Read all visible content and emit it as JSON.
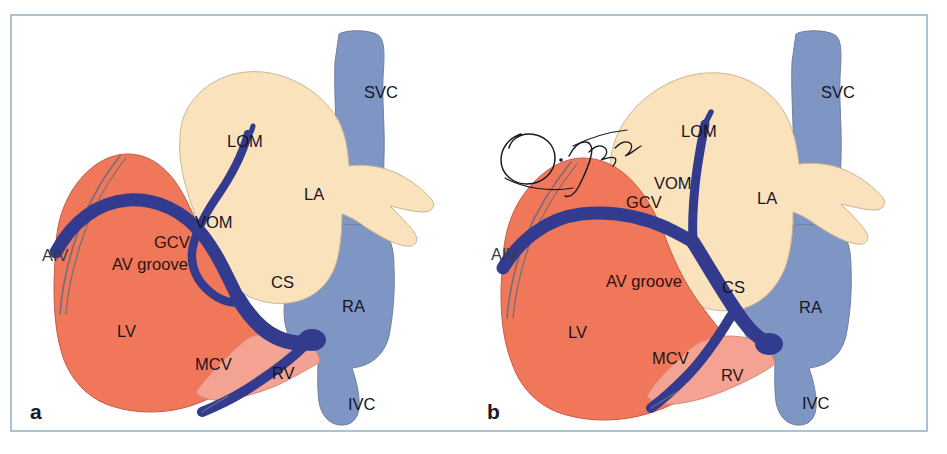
{
  "figure": {
    "kind": "anatomical-illustration",
    "panel_count": 2,
    "frame_color": "#a9c3d4",
    "background": "#ffffff"
  },
  "colors": {
    "left_ventricle_red": "#f0775a",
    "right_ventricle_pink": "#f4a393",
    "atrium_cream": "#fae2bc",
    "venous_blue": "#7f96c4",
    "vein_navy": "#323b8d",
    "outline_grey": "#6f6f7a",
    "label_black": "#15151f",
    "label_dark_brown": "#2a1410"
  },
  "panels": [
    {
      "id": "a",
      "letter": "a",
      "signature": null,
      "labels": [
        {
          "key": "svc",
          "text": "SVC",
          "x": 352,
          "y": 82,
          "tone": "dark-blue"
        },
        {
          "key": "lom",
          "text": "LOM",
          "x": 215,
          "y": 131,
          "tone": "black"
        },
        {
          "key": "la",
          "text": "LA",
          "x": 292,
          "y": 184,
          "tone": "black"
        },
        {
          "key": "vom",
          "text": "VOM",
          "x": 183,
          "y": 212,
          "tone": "black"
        },
        {
          "key": "gcv",
          "text": "GCV",
          "x": 142,
          "y": 232,
          "tone": "brown"
        },
        {
          "key": "av_groove",
          "text": "AV groove",
          "x": 100,
          "y": 254,
          "tone": "brown"
        },
        {
          "key": "aiv",
          "text": "AIV",
          "x": 30,
          "y": 245,
          "tone": "grey"
        },
        {
          "key": "cs",
          "text": "CS",
          "x": 259,
          "y": 272,
          "tone": "black"
        },
        {
          "key": "ra",
          "text": "RA",
          "x": 330,
          "y": 296,
          "tone": "black"
        },
        {
          "key": "lv",
          "text": "LV",
          "x": 105,
          "y": 321,
          "tone": "black"
        },
        {
          "key": "mcv",
          "text": "MCV",
          "x": 183,
          "y": 354,
          "tone": "black"
        },
        {
          "key": "rv",
          "text": "RV",
          "x": 260,
          "y": 363,
          "tone": "black"
        },
        {
          "key": "ivc",
          "text": "IVC",
          "x": 336,
          "y": 394,
          "tone": "black"
        }
      ]
    },
    {
      "id": "b",
      "letter": "b",
      "signature": "O. Igausa",
      "labels": [
        {
          "key": "svc",
          "text": "SVC",
          "x": 352,
          "y": 82,
          "tone": "dark-blue"
        },
        {
          "key": "lom",
          "text": "LOM",
          "x": 212,
          "y": 121,
          "tone": "black"
        },
        {
          "key": "vom",
          "text": "VOM",
          "x": 185,
          "y": 173,
          "tone": "black"
        },
        {
          "key": "gcv",
          "text": "GCV",
          "x": 157,
          "y": 192,
          "tone": "brown"
        },
        {
          "key": "la",
          "text": "LA",
          "x": 288,
          "y": 188,
          "tone": "black"
        },
        {
          "key": "aiv",
          "text": "AIV",
          "x": 22,
          "y": 244,
          "tone": "grey"
        },
        {
          "key": "av_groove",
          "text": "AV groove",
          "x": 137,
          "y": 271,
          "tone": "brown"
        },
        {
          "key": "cs",
          "text": "CS",
          "x": 253,
          "y": 277,
          "tone": "black"
        },
        {
          "key": "ra",
          "text": "RA",
          "x": 330,
          "y": 297,
          "tone": "black"
        },
        {
          "key": "lv",
          "text": "LV",
          "x": 99,
          "y": 322,
          "tone": "black"
        },
        {
          "key": "mcv",
          "text": "MCV",
          "x": 183,
          "y": 348,
          "tone": "brown"
        },
        {
          "key": "rv",
          "text": "RV",
          "x": 252,
          "y": 365,
          "tone": "brown"
        },
        {
          "key": "ivc",
          "text": "IVC",
          "x": 333,
          "y": 393,
          "tone": "black"
        }
      ]
    }
  ],
  "legend_terms": {
    "SVC": "superior vena cava",
    "IVC": "inferior vena cava",
    "LA": "left atrium",
    "RA": "right atrium",
    "LV": "left ventricle",
    "RV": "right ventricle",
    "CS": "coronary sinus",
    "GCV": "great cardiac vein",
    "MCV": "middle cardiac vein",
    "AIV": "anterior interventricular vein",
    "VOM": "vein of Marshall",
    "LOM": "ligament of Marshall",
    "AV groove": "atrioventricular groove"
  }
}
